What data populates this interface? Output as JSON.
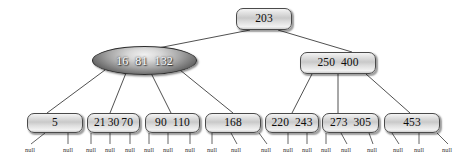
{
  "diagram": {
    "type": "b-tree",
    "null_label": "null",
    "colors": {
      "background": "#ffffff",
      "node_border": "#4a4a4a",
      "node_fill_light": "#e2e2e2",
      "ellipse_fill_dark": "#4b4b4b",
      "edge": "#3c3c3c",
      "text": "#101010",
      "ellipse_text": "#ffffff",
      "null_text": "#333333"
    },
    "nodes": [
      {
        "id": "root",
        "shape": "rounded-rect",
        "keys": [
          "203"
        ],
        "x": 236,
        "y": 8,
        "w": 56,
        "h": 22,
        "level": 0
      },
      {
        "id": "internal-left",
        "shape": "ellipse",
        "keys": [
          "16",
          "81",
          "132"
        ],
        "x": 92,
        "y": 46,
        "w": 105,
        "h": 29,
        "level": 1
      },
      {
        "id": "internal-right",
        "shape": "rounded-rect",
        "keys": [
          "250",
          "400"
        ],
        "x": 300,
        "y": 52,
        "w": 76,
        "h": 22,
        "level": 1
      },
      {
        "id": "leaf-1",
        "shape": "rounded-rect",
        "keys": [
          "5"
        ],
        "x": 27,
        "y": 113,
        "w": 56,
        "h": 20,
        "level": 2
      },
      {
        "id": "leaf-2",
        "shape": "rounded-rect",
        "keys": [
          "21",
          "30",
          "70"
        ],
        "x": 87,
        "y": 113,
        "w": 53,
        "h": 20,
        "level": 2
      },
      {
        "id": "leaf-3",
        "shape": "rounded-rect",
        "keys": [
          "90",
          "110"
        ],
        "x": 145,
        "y": 113,
        "w": 55,
        "h": 20,
        "level": 2
      },
      {
        "id": "leaf-4",
        "shape": "rounded-rect",
        "keys": [
          "168"
        ],
        "x": 205,
        "y": 113,
        "w": 56,
        "h": 20,
        "level": 2
      },
      {
        "id": "leaf-5",
        "shape": "rounded-rect",
        "keys": [
          "220",
          "243"
        ],
        "x": 265,
        "y": 113,
        "w": 54,
        "h": 20,
        "level": 2
      },
      {
        "id": "leaf-6",
        "shape": "rounded-rect",
        "keys": [
          "273",
          "305"
        ],
        "x": 322,
        "y": 113,
        "w": 57,
        "h": 20,
        "level": 2
      },
      {
        "id": "leaf-7",
        "shape": "rounded-rect",
        "keys": [
          "453"
        ],
        "x": 384,
        "y": 113,
        "w": 56,
        "h": 20,
        "level": 2
      }
    ],
    "edges": [
      {
        "from": "root",
        "to": "internal-left",
        "x1": 250,
        "y1": 30,
        "x2": 158,
        "y2": 48
      },
      {
        "from": "root",
        "to": "internal-right",
        "x1": 278,
        "y1": 30,
        "x2": 352,
        "y2": 52
      },
      {
        "from": "internal-left",
        "to": "leaf-1",
        "x1": 105,
        "y1": 70,
        "x2": 47,
        "y2": 113
      },
      {
        "from": "internal-left",
        "to": "leaf-2",
        "x1": 126,
        "y1": 73,
        "x2": 110,
        "y2": 113
      },
      {
        "from": "internal-left",
        "to": "leaf-3",
        "x1": 151,
        "y1": 73,
        "x2": 171,
        "y2": 113
      },
      {
        "from": "internal-left",
        "to": "leaf-4",
        "x1": 180,
        "y1": 70,
        "x2": 233,
        "y2": 113
      },
      {
        "from": "internal-right",
        "to": "leaf-5",
        "x1": 312,
        "y1": 74,
        "x2": 292,
        "y2": 113
      },
      {
        "from": "internal-right",
        "to": "leaf-6",
        "x1": 338,
        "y1": 74,
        "x2": 338,
        "y2": 113
      },
      {
        "from": "internal-right",
        "to": "leaf-7",
        "x1": 366,
        "y1": 74,
        "x2": 410,
        "y2": 113
      }
    ],
    "null_leaves": [
      {
        "parent": "leaf-1",
        "label": "null",
        "x": 30,
        "y": 147,
        "x1": 45,
        "y1": 133,
        "x2": 31,
        "y2": 144
      },
      {
        "parent": "leaf-1",
        "label": "null",
        "x": 68,
        "y": 147,
        "x1": 68,
        "y1": 133,
        "x2": 68,
        "y2": 144
      },
      {
        "parent": "leaf-2",
        "label": "null",
        "x": 91,
        "y": 147,
        "x1": 91,
        "y1": 133,
        "x2": 91,
        "y2": 144
      },
      {
        "parent": "leaf-2",
        "label": "null",
        "x": 110,
        "y": 147,
        "x1": 110,
        "y1": 133,
        "x2": 110,
        "y2": 144
      },
      {
        "parent": "leaf-2",
        "label": "null",
        "x": 130,
        "y": 147,
        "x1": 130,
        "y1": 133,
        "x2": 130,
        "y2": 144
      },
      {
        "parent": "leaf-2",
        "label": "null",
        "x": 149,
        "y": 147,
        "x1": 149,
        "y1": 133,
        "x2": 149,
        "y2": 144
      },
      {
        "parent": "leaf-3",
        "label": "null",
        "x": 168,
        "y": 147,
        "x1": 168,
        "y1": 133,
        "x2": 168,
        "y2": 144
      },
      {
        "parent": "leaf-3",
        "label": "null",
        "x": 190,
        "y": 147,
        "x1": 190,
        "y1": 133,
        "x2": 190,
        "y2": 144
      },
      {
        "parent": "leaf-3",
        "label": "null",
        "x": 212,
        "y": 147,
        "x1": 212,
        "y1": 133,
        "x2": 212,
        "y2": 144
      },
      {
        "parent": "leaf-4",
        "label": "null",
        "x": 236,
        "y": 147,
        "x1": 231,
        "y1": 133,
        "x2": 237,
        "y2": 144
      },
      {
        "parent": "leaf-4",
        "label": "null",
        "x": 266,
        "y": 147,
        "x1": 259,
        "y1": 133,
        "x2": 267,
        "y2": 144
      },
      {
        "parent": "leaf-5",
        "label": "null",
        "x": 288,
        "y": 147,
        "x1": 288,
        "y1": 133,
        "x2": 288,
        "y2": 144
      },
      {
        "parent": "leaf-5",
        "label": "null",
        "x": 307,
        "y": 147,
        "x1": 307,
        "y1": 133,
        "x2": 307,
        "y2": 144
      },
      {
        "parent": "leaf-5",
        "label": "null",
        "x": 326,
        "y": 147,
        "x1": 326,
        "y1": 133,
        "x2": 326,
        "y2": 144
      },
      {
        "parent": "leaf-6",
        "label": "null",
        "x": 346,
        "y": 147,
        "x1": 341,
        "y1": 133,
        "x2": 347,
        "y2": 144
      },
      {
        "parent": "leaf-6",
        "label": "null",
        "x": 372,
        "y": 147,
        "x1": 369,
        "y1": 133,
        "x2": 373,
        "y2": 144
      },
      {
        "parent": "leaf-6",
        "label": "null",
        "x": 398,
        "y": 147,
        "x1": 392,
        "y1": 133,
        "x2": 399,
        "y2": 144
      },
      {
        "parent": "leaf-7",
        "label": "null",
        "x": 419,
        "y": 147,
        "x1": 419,
        "y1": 133,
        "x2": 419,
        "y2": 144
      },
      {
        "parent": "leaf-7",
        "label": "null",
        "x": 447,
        "y": 147,
        "x1": 437,
        "y1": 133,
        "x2": 448,
        "y2": 144
      }
    ]
  }
}
